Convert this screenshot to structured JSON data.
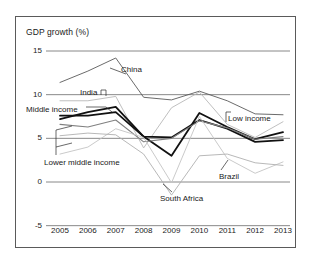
{
  "chart_data": {
    "type": "line",
    "title": "GDP growth (%)",
    "xlabel": "",
    "ylabel": "GDP growth (%)",
    "x": [
      "2005",
      "2006",
      "2007",
      "2008",
      "2009",
      "2010",
      "2011",
      "2012",
      "2013"
    ],
    "categories": [
      "2005",
      "2006",
      "2007",
      "2008",
      "2009",
      "2010",
      "2011",
      "2012",
      "2013"
    ],
    "ylim": [
      -5,
      15
    ],
    "yticks": [
      "15",
      "10",
      "5",
      "0",
      "-5"
    ],
    "ytick_values": [
      15,
      10,
      5,
      0,
      -5
    ],
    "grid": true,
    "legend": "inline-annotations",
    "series": [
      {
        "name": "China",
        "color": "#5a5a5a",
        "width": 0.9,
        "values": [
          11.4,
          12.7,
          14.2,
          9.7,
          9.4,
          10.4,
          9.3,
          7.8,
          7.7
        ]
      },
      {
        "name": "India",
        "color": "#b8b8b8",
        "width": 0.9,
        "values": [
          9.3,
          9.3,
          9.8,
          3.9,
          8.5,
          10.3,
          6.6,
          5.1,
          6.9
        ]
      },
      {
        "name": "Middle income",
        "color": "#111111",
        "width": 1.8,
        "values": [
          7.2,
          8.0,
          8.6,
          5.2,
          3.0,
          7.9,
          6.3,
          4.9,
          5.7
        ]
      },
      {
        "name": "Low income",
        "color": "#111111",
        "width": 1.8,
        "values": [
          7.6,
          7.6,
          8.0,
          5.2,
          5.1,
          7.1,
          6.1,
          4.6,
          4.8
        ]
      },
      {
        "name": "Lower middle income",
        "color": "#808080",
        "width": 1.1,
        "values": [
          6.6,
          6.3,
          7.1,
          4.6,
          5.0,
          7.0,
          6.2,
          4.9,
          5.2
        ]
      },
      {
        "name": "Brazil",
        "color": "#c4c4c4",
        "width": 0.9,
        "values": [
          3.2,
          4.0,
          6.1,
          5.1,
          -0.1,
          7.5,
          2.7,
          1.0,
          2.3
        ]
      },
      {
        "name": "South Africa",
        "color": "#b0b0b0",
        "width": 0.9,
        "values": [
          5.3,
          5.6,
          5.4,
          3.2,
          -1.5,
          3.0,
          3.2,
          2.2,
          1.9
        ]
      }
    ],
    "annotations": [
      {
        "label": "China",
        "x": 121,
        "y": 65
      },
      {
        "label": "India",
        "x": 80,
        "y": 88
      },
      {
        "label": "Middle income",
        "x": 26,
        "y": 105
      },
      {
        "label": "Lower middle income",
        "x": 44,
        "y": 158
      },
      {
        "label": "Low income",
        "x": 228,
        "y": 114
      },
      {
        "label": "Brazil",
        "x": 219,
        "y": 172
      },
      {
        "label": "South Africa",
        "x": 160,
        "y": 194
      }
    ]
  }
}
